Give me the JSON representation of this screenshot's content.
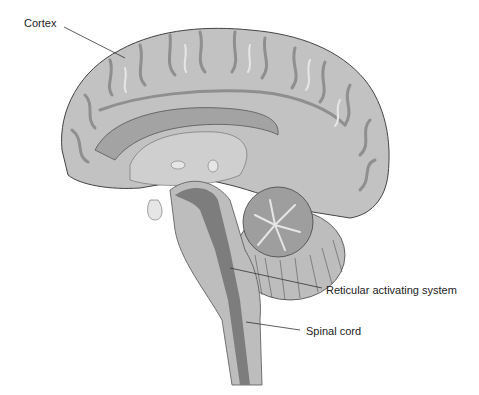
{
  "figure": {
    "labels": [
      {
        "id": "cortex",
        "text": "Cortex",
        "x": 24,
        "y": 17
      },
      {
        "id": "reticular",
        "text": "Reticular activating system",
        "x": 326,
        "y": 284
      },
      {
        "id": "spinal",
        "text": "Spinal cord",
        "x": 306,
        "y": 325
      }
    ],
    "colors": {
      "cortex_fill": "#c2c2c2",
      "sulcus": "#8f8f8f",
      "highlight": "#e6e6e6",
      "corpus_callosum": "#a3a3a3",
      "brainstem": "#bdbdbd",
      "canal": "#7d7d7d",
      "cerebellum": "#9e9e9e",
      "outline": "#444444"
    }
  }
}
